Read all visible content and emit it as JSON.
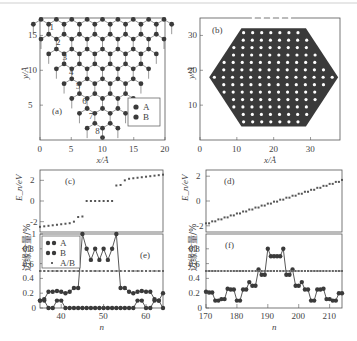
{
  "figure": {
    "top_rule_color": "#cfcfcf",
    "atom_color": "#3a3a3a",
    "line_color": "#555555"
  },
  "chart_data": [
    {
      "id": "a",
      "type": "scatter",
      "panel_label": "(a)",
      "title": "",
      "xlabel": "x/Å",
      "ylabel": "y/Å",
      "xlim": [
        0,
        20
      ],
      "ylim": [
        0,
        17.5
      ],
      "xticks": [
        "0",
        "5",
        "10",
        "15",
        "20"
      ],
      "yticks": [
        "5",
        "10",
        "15"
      ],
      "description": "Triangular graphene flake (zigzag edges), apex at bottom (x≈10, y≈0.5), top edge at y≈17.5",
      "row_labels": [
        "1",
        "2",
        "3",
        "4",
        "5",
        "6",
        "7",
        "8"
      ],
      "legend": [
        "A",
        "B"
      ],
      "legend_position": "lower right"
    },
    {
      "id": "b",
      "type": "scatter",
      "panel_label": "(b)",
      "title": "",
      "xlabel": "x/Å",
      "ylabel": "y/Å",
      "xlim": [
        0,
        38
      ],
      "ylim": [
        0,
        35
      ],
      "xticks": [
        "0",
        "10",
        "20",
        "30"
      ],
      "yticks": [
        "10",
        "20",
        "30"
      ],
      "description": "Hexagonal graphene flake with zigzag edges, spanning x≈2–37, y≈2–34"
    },
    {
      "id": "c",
      "type": "scatter",
      "panel_label": "(c)",
      "xlabel": "",
      "ylabel": "E_n/eV",
      "xlim": [
        35,
        64
      ],
      "ylim": [
        -3,
        3
      ],
      "yticks": [
        "-2",
        "0",
        "2"
      ],
      "x": [
        35,
        36,
        37,
        38,
        39,
        40,
        41,
        42,
        43,
        44,
        45,
        46,
        47,
        48,
        49,
        50,
        51,
        52,
        53,
        54,
        55,
        56,
        57,
        58,
        59,
        60,
        61,
        62,
        63,
        64
      ],
      "values": [
        -2.5,
        -2.45,
        -2.4,
        -2.35,
        -2.3,
        -2.25,
        -2.2,
        -2.15,
        -2.0,
        -1.55,
        -1.5,
        0,
        0,
        0,
        0,
        0,
        0,
        0,
        1.5,
        1.55,
        2.0,
        2.15,
        2.2,
        2.25,
        2.3,
        2.35,
        2.4,
        2.45,
        2.5,
        2.55
      ]
    },
    {
      "id": "d",
      "type": "scatter",
      "panel_label": "(d)",
      "xlabel": "",
      "ylabel": "E_n/eV",
      "xlim": [
        170,
        214
      ],
      "ylim": [
        -2.5,
        2.5
      ],
      "yticks": [
        "-2",
        "0",
        "2"
      ],
      "x_range": [
        170,
        214
      ],
      "values_start": -1.8,
      "values_end": 1.7,
      "description": "Near-linear staircase increase from ≈-1.8 eV to ≈1.7 eV"
    },
    {
      "id": "e",
      "type": "line",
      "panel_label": "(e)",
      "xlabel": "n",
      "ylabel": "边缘含量/%",
      "xlim": [
        35,
        64
      ],
      "ylim": [
        0,
        1
      ],
      "xticks": [
        "40",
        "50",
        "60"
      ],
      "yticks": [
        "0",
        "0.2",
        "0.4",
        "0.6",
        "0.8",
        "1"
      ],
      "legend": [
        "A",
        "B",
        "A/B"
      ],
      "legend_position": "upper left",
      "x": [
        35,
        36,
        37,
        38,
        39,
        40,
        41,
        42,
        43,
        44,
        45,
        46,
        47,
        48,
        49,
        50,
        51,
        52,
        53,
        54,
        55,
        56,
        57,
        58,
        59,
        60,
        61,
        62,
        63,
        64
      ],
      "series": [
        {
          "name": "A",
          "values": [
            0.1,
            0.1,
            0,
            0,
            0.1,
            0.1,
            0,
            0,
            0,
            0,
            0,
            0,
            0,
            0,
            0,
            0,
            0,
            0,
            0,
            0,
            0,
            0,
            0,
            0.1,
            0.1,
            0,
            0,
            0.1,
            0.1,
            0
          ]
        },
        {
          "name": "B",
          "values": [
            0.1,
            0.12,
            0.22,
            0.22,
            0.23,
            0.22,
            0.2,
            0.22,
            0.27,
            0.27,
            1.0,
            0.8,
            0.65,
            0.8,
            0.65,
            0.8,
            0.65,
            0.8,
            1.0,
            0.27,
            0.27,
            0.22,
            0.2,
            0.22,
            0.23,
            0.22,
            0.22,
            0.12,
            0.1,
            0.2
          ]
        },
        {
          "name": "A/B",
          "values": [
            0.5,
            0.5,
            0.5,
            0.5,
            0.5,
            0.5,
            0.5,
            0.5,
            0.5,
            0.5,
            0.5,
            0.5,
            0.5,
            0.5,
            0.5,
            0.5,
            0.5,
            0.5,
            0.5,
            0.5,
            0.5,
            0.5,
            0.5,
            0.5,
            0.5,
            0.5,
            0.5,
            0.5,
            0.5,
            0.5
          ]
        }
      ]
    },
    {
      "id": "f",
      "type": "line",
      "panel_label": "(f)",
      "xlabel": "n",
      "ylabel": "边缘含量/%",
      "xlim": [
        170,
        214
      ],
      "ylim": [
        0,
        1
      ],
      "xticks": [
        "170",
        "180",
        "190",
        "200",
        "210"
      ],
      "yticks": [
        "0",
        "0.2",
        "0.4",
        "0.6",
        "0.8"
      ],
      "x": [
        170,
        171,
        172,
        173,
        174,
        175,
        176,
        177,
        178,
        179,
        180,
        181,
        182,
        183,
        184,
        185,
        186,
        187,
        188,
        189,
        190,
        191,
        192,
        193,
        194,
        195,
        196,
        197,
        198,
        199,
        200,
        201,
        202,
        203,
        204,
        205,
        206,
        207,
        208,
        209,
        210,
        211,
        212,
        213,
        214
      ],
      "series": [
        {
          "name": "edge",
          "values": [
            0.22,
            0.21,
            0.21,
            0.1,
            0.1,
            0.12,
            0.12,
            0.26,
            0.25,
            0.25,
            0.1,
            0.1,
            0.25,
            0.25,
            0.35,
            0.3,
            0.3,
            0.52,
            0.45,
            0.45,
            0.8,
            0.7,
            0.7,
            0.7,
            0.7,
            0.8,
            0.45,
            0.45,
            0.52,
            0.3,
            0.3,
            0.35,
            0.25,
            0.25,
            0.1,
            0.1,
            0.25,
            0.25,
            0.26,
            0.12,
            0.12,
            0.1,
            0.1,
            0.2,
            0.2
          ]
        },
        {
          "name": "A/B",
          "values": [
            0.5,
            0.5,
            0.5,
            0.5,
            0.5,
            0.5,
            0.5,
            0.5,
            0.5,
            0.5,
            0.5,
            0.5,
            0.5,
            0.5,
            0.5,
            0.5,
            0.5,
            0.5,
            0.5,
            0.5,
            0.5,
            0.5,
            0.5,
            0.5,
            0.5,
            0.5,
            0.5,
            0.5,
            0.5,
            0.5,
            0.5,
            0.5,
            0.5,
            0.5,
            0.5,
            0.5,
            0.5,
            0.5,
            0.5,
            0.5,
            0.5,
            0.5,
            0.5,
            0.5,
            0.5
          ]
        }
      ]
    }
  ]
}
